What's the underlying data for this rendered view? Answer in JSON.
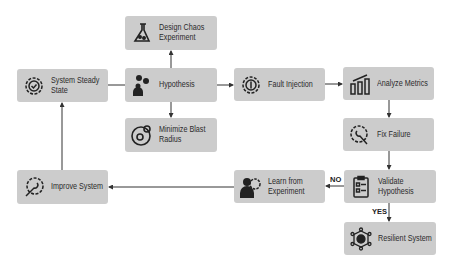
{
  "nodes": {
    "design": {
      "label_1": "Design Chaos",
      "label_2": "Experiment",
      "icon": "flask-icon"
    },
    "steady": {
      "label_1": "System Steady",
      "label_2": "State",
      "icon": "gear-check-icon"
    },
    "hypothesis": {
      "label_1": "Hypothesis",
      "icon": "person-gears-icon"
    },
    "fault": {
      "label_1": "Fault Injection",
      "icon": "gear-power-icon"
    },
    "analyze": {
      "label_1": "Analyze Metrics",
      "icon": "bar-chart-icon"
    },
    "minimize": {
      "label_1": "Minimize Blast",
      "label_2": "Radius",
      "icon": "blast-radius-icon"
    },
    "fix": {
      "label_1": "Fix Failure",
      "icon": "gear-wrench-icon"
    },
    "improve": {
      "label_1": "Improve System",
      "icon": "gear-wrench-icon"
    },
    "learn": {
      "label_1": "Learn from",
      "label_2": "Experiment",
      "icon": "person-gear-icon"
    },
    "validate": {
      "label_1": "Validate",
      "label_2": "Hypothesis",
      "icon": "clipboard-icon"
    },
    "resilient": {
      "label_1": "Resilient System",
      "icon": "network-gear-icon"
    }
  },
  "edges": {
    "no_label": "NO",
    "yes_label": "YES"
  },
  "colors": {
    "box": "#cccccc",
    "line": "#333333",
    "icon": "#222222"
  }
}
